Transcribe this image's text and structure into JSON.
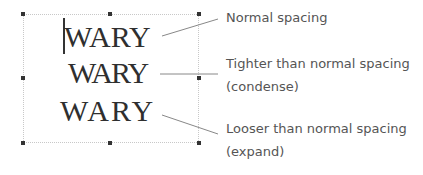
{
  "samples": [
    {
      "text": "WARY",
      "spacing": "normal"
    },
    {
      "text": "WARY",
      "spacing": "condensed"
    },
    {
      "text": "WARY",
      "spacing": "expanded"
    }
  ],
  "labels": [
    {
      "line1": "Normal spacing"
    },
    {
      "line1": "Tighter than normal spacing",
      "line2": "(condense)"
    },
    {
      "line1": "Looser than normal spacing",
      "line2": "(expand)"
    }
  ]
}
